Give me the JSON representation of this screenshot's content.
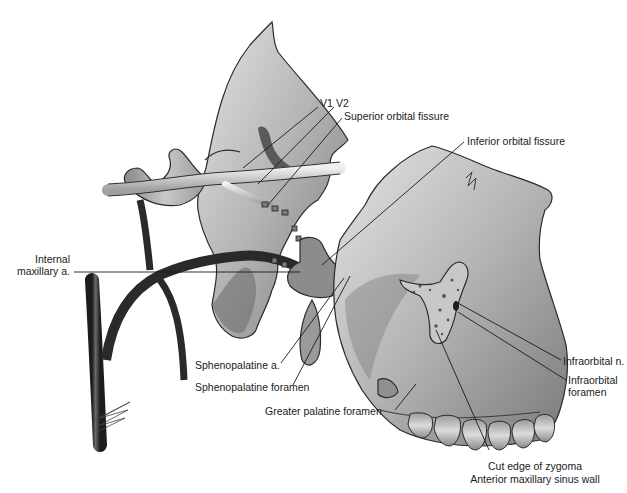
{
  "figure": {
    "type": "anatomical illustration",
    "style": "grayscale",
    "labels": {
      "v1": "V1",
      "v2": "V2",
      "superior_orbital_fissure": "Superior orbital fissure",
      "inferior_orbital_fissure": "Inferior orbital fissure",
      "internal_maxillary_line1": "Internal",
      "internal_maxillary_line2": "maxillary a.",
      "infraorbital_n": "Infraorbital n.",
      "infraorbital_foramen_line1": "Infraorbital",
      "infraorbital_foramen_line2": "foramen",
      "sphenopalatine_a": "Sphenopalatine a.",
      "sphenopalatine_foramen": "Sphenopalatine foramen",
      "greater_palatine_foramen": "Greater palatine foramen",
      "cut_edge_zygoma": "Cut edge of zygoma",
      "anterior_maxillary_sinus_wall": "Anterior maxillary sinus wall"
    },
    "colors": {
      "background": "#ffffff",
      "text": "#1a1a1a",
      "bone_light": "#d6d6d6",
      "bone_mid": "#a8a8a8",
      "bone_dark": "#5a5a5a",
      "vessel": "#2e2e2e"
    }
  }
}
